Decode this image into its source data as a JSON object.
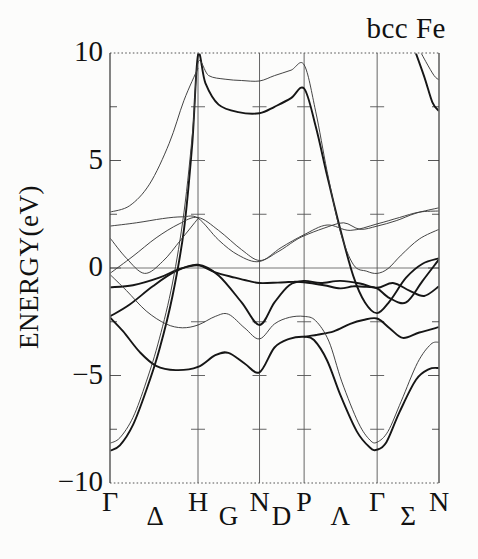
{
  "title": "bcc Fe",
  "chart_data": {
    "type": "line",
    "title": "bcc Fe",
    "subtitle": "electronic band structure, spin-polarized (thick = majority spin, thin = minority spin)",
    "ylabel": "ENERGY(eV)",
    "xlabel": "",
    "ylim": [
      -10,
      10
    ],
    "grid": "vertical lines at interior high-symmetry points; tick crosses every 2.5 eV",
    "legend_position": "none",
    "fermi_energy": 0,
    "yticks": [
      {
        "label": "10",
        "value": 10
      },
      {
        "label": "5",
        "value": 5
      },
      {
        "label": "0",
        "value": 0
      },
      {
        "label": "−5",
        "value": -5
      },
      {
        "label": "−10",
        "value": -10
      }
    ],
    "minor_tick_step_ev": 2.5,
    "kpath": {
      "points": [
        {
          "label": "Γ",
          "k": 0.0
        },
        {
          "label": "H",
          "k": 0.2675
        },
        {
          "label": "N",
          "k": 0.4545
        },
        {
          "label": "P",
          "k": 0.59
        },
        {
          "label": "Γ",
          "k": 0.812
        },
        {
          "label": "N",
          "k": 1.0
        }
      ],
      "segments": [
        {
          "label": "Δ",
          "k": 0.137
        },
        {
          "label": "G",
          "k": 0.36
        },
        {
          "label": "D",
          "k": 0.521
        },
        {
          "label": "Λ",
          "k": 0.7
        },
        {
          "label": "Σ",
          "k": 0.906
        }
      ]
    },
    "colors": {
      "band_majority": "#161616",
      "band_minority": "#3a3a3a",
      "frame": "#333333",
      "gridline": "#555555",
      "fermi_line": "#555555",
      "background": "#fcfcfb"
    },
    "series": [
      {
        "name": "majority-spin",
        "line_width": 1.9,
        "color": "#161616",
        "bands": [
          [
            [
              0,
              -8.5
            ],
            [
              0.03,
              -8.25
            ],
            [
              0.07,
              -7.3
            ],
            [
              0.11,
              -5.7
            ],
            [
              0.15,
              -3.8
            ],
            [
              0.19,
              -1.3
            ],
            [
              0.225,
              1.8
            ],
            [
              0.25,
              5.8
            ],
            [
              0.2675,
              9.9
            ],
            [
              0.29,
              8.6
            ],
            [
              0.33,
              7.6
            ],
            [
              0.39,
              7.25
            ],
            [
              0.4545,
              7.2
            ],
            [
              0.5,
              7.5
            ],
            [
              0.55,
              7.9
            ],
            [
              0.59,
              8.35
            ],
            [
              0.625,
              6.6
            ],
            [
              0.66,
              4.3
            ],
            [
              0.7,
              1.8
            ],
            [
              0.74,
              -0.4
            ],
            [
              0.775,
              -1.6
            ],
            [
              0.812,
              -2.1
            ],
            [
              0.85,
              -1.55
            ],
            [
              0.9,
              -0.45
            ],
            [
              0.95,
              0.2
            ],
            [
              1,
              0.45
            ]
          ],
          [
            [
              0,
              -2.3
            ],
            [
              0.04,
              -2.95
            ],
            [
              0.09,
              -3.9
            ],
            [
              0.14,
              -4.55
            ],
            [
              0.2,
              -4.75
            ],
            [
              0.2675,
              -4.6
            ],
            [
              0.32,
              -4.05
            ],
            [
              0.36,
              -3.95
            ],
            [
              0.41,
              -4.45
            ],
            [
              0.4545,
              -4.85
            ],
            [
              0.5,
              -3.7
            ],
            [
              0.545,
              -3.3
            ],
            [
              0.59,
              -3.2
            ],
            [
              0.62,
              -3.35
            ],
            [
              0.66,
              -4.3
            ],
            [
              0.7,
              -5.9
            ],
            [
              0.75,
              -7.6
            ],
            [
              0.79,
              -8.35
            ],
            [
              0.812,
              -8.45
            ],
            [
              0.84,
              -8.1
            ],
            [
              0.88,
              -6.7
            ],
            [
              0.93,
              -5.2
            ],
            [
              0.97,
              -4.7
            ],
            [
              1,
              -4.65
            ]
          ],
          [
            [
              0,
              -2.25
            ],
            [
              0.06,
              -1.7
            ],
            [
              0.13,
              -0.85
            ],
            [
              0.2,
              -0.15
            ],
            [
              0.2675,
              0.15
            ],
            [
              0.33,
              -0.35
            ],
            [
              0.4,
              -1.6
            ],
            [
              0.4545,
              -2.65
            ],
            [
              0.5,
              -1.6
            ],
            [
              0.545,
              -0.8
            ],
            [
              0.59,
              -0.6
            ],
            [
              0.64,
              -0.7
            ],
            [
              0.7,
              -0.6
            ],
            [
              0.76,
              -0.72
            ],
            [
              0.812,
              -0.92
            ],
            [
              0.86,
              -0.7
            ],
            [
              0.91,
              -1.05
            ],
            [
              0.955,
              -1.3
            ],
            [
              1,
              -0.85
            ]
          ],
          [
            [
              0,
              -0.9
            ],
            [
              0.07,
              -0.8
            ],
            [
              0.15,
              -0.45
            ],
            [
              0.21,
              -0.05
            ],
            [
              0.2675,
              0.12
            ],
            [
              0.32,
              -0.2
            ],
            [
              0.38,
              -0.45
            ],
            [
              0.42,
              -0.6
            ],
            [
              0.4545,
              -0.7
            ],
            [
              0.51,
              -0.68
            ],
            [
              0.56,
              -0.64
            ],
            [
              0.59,
              -0.66
            ],
            [
              0.65,
              -0.8
            ],
            [
              0.7,
              -0.95
            ],
            [
              0.74,
              -0.85
            ],
            [
              0.78,
              -0.88
            ],
            [
              0.812,
              -0.95
            ],
            [
              0.85,
              -1.4
            ],
            [
              0.9,
              -1.6
            ],
            [
              0.95,
              -0.6
            ],
            [
              1,
              0.4
            ]
          ],
          [
            [
              0.92,
              10.4
            ],
            [
              0.955,
              8.9
            ],
            [
              0.98,
              7.7
            ],
            [
              1,
              7.3
            ]
          ],
          [
            [
              0.59,
              -3.2
            ],
            [
              0.63,
              -3.1
            ],
            [
              0.68,
              -2.95
            ],
            [
              0.73,
              -2.6
            ],
            [
              0.77,
              -2.42
            ],
            [
              0.812,
              -2.35
            ],
            [
              0.85,
              -2.8
            ],
            [
              0.89,
              -3.25
            ],
            [
              0.94,
              -3.0
            ],
            [
              1,
              -2.75
            ]
          ]
        ]
      },
      {
        "name": "minority-spin",
        "line_width": 0.95,
        "color": "#3a3a3a",
        "bands": [
          [
            [
              0,
              -8.15
            ],
            [
              0.03,
              -7.9
            ],
            [
              0.07,
              -6.95
            ],
            [
              0.11,
              -5.3
            ],
            [
              0.15,
              -3.3
            ],
            [
              0.19,
              -0.7
            ],
            [
              0.225,
              2.6
            ],
            [
              0.252,
              6.5
            ],
            [
              0.2675,
              9.55
            ],
            [
              0.3,
              8.95
            ],
            [
              0.35,
              8.78
            ],
            [
              0.4,
              8.72
            ],
            [
              0.4545,
              8.7
            ],
            [
              0.5,
              8.95
            ],
            [
              0.55,
              9.2
            ],
            [
              0.59,
              9.45
            ],
            [
              0.625,
              7.3
            ],
            [
              0.66,
              4.5
            ],
            [
              0.7,
              1.7
            ],
            [
              0.74,
              0.15
            ],
            [
              0.78,
              -0.15
            ],
            [
              0.812,
              -0.25
            ],
            [
              0.845,
              -0.03
            ],
            [
              0.885,
              0.6
            ],
            [
              0.94,
              1.35
            ],
            [
              1,
              1.8
            ]
          ],
          [
            [
              0,
              -0.3
            ],
            [
              0.05,
              -1.05
            ],
            [
              0.11,
              -2.0
            ],
            [
              0.17,
              -2.6
            ],
            [
              0.22,
              -2.78
            ],
            [
              0.2675,
              -2.65
            ],
            [
              0.32,
              -2.25
            ],
            [
              0.36,
              -2.15
            ],
            [
              0.41,
              -2.8
            ],
            [
              0.4545,
              -3.3
            ],
            [
              0.5,
              -2.6
            ],
            [
              0.545,
              -2.3
            ],
            [
              0.59,
              -2.25
            ],
            [
              0.625,
              -2.45
            ],
            [
              0.665,
              -3.4
            ],
            [
              0.705,
              -5.3
            ],
            [
              0.755,
              -7.2
            ],
            [
              0.79,
              -8.0
            ],
            [
              0.812,
              -8.1
            ],
            [
              0.845,
              -7.6
            ],
            [
              0.885,
              -6.2
            ],
            [
              0.935,
              -4.4
            ],
            [
              0.975,
              -3.55
            ],
            [
              1,
              -3.45
            ]
          ],
          [
            [
              0,
              -0.25
            ],
            [
              0.07,
              0.55
            ],
            [
              0.14,
              1.4
            ],
            [
              0.21,
              2.05
            ],
            [
              0.2675,
              2.35
            ],
            [
              0.33,
              1.75
            ],
            [
              0.4,
              0.85
            ],
            [
              0.4545,
              0.35
            ],
            [
              0.51,
              0.75
            ],
            [
              0.56,
              1.25
            ],
            [
              0.59,
              1.5
            ],
            [
              0.65,
              1.85
            ],
            [
              0.71,
              2.1
            ],
            [
              0.76,
              1.8
            ],
            [
              0.812,
              1.95
            ],
            [
              0.87,
              2.2
            ],
            [
              0.93,
              2.55
            ],
            [
              1,
              2.8
            ]
          ],
          [
            [
              0,
              1.95
            ],
            [
              0.08,
              2.1
            ],
            [
              0.16,
              2.3
            ],
            [
              0.22,
              2.38
            ],
            [
              0.2675,
              2.32
            ],
            [
              0.33,
              1.3
            ],
            [
              0.39,
              0.6
            ],
            [
              0.4545,
              0.3
            ],
            [
              0.52,
              0.95
            ],
            [
              0.59,
              1.55
            ],
            [
              0.66,
              2.0
            ],
            [
              0.73,
              1.75
            ],
            [
              0.812,
              2.05
            ],
            [
              0.88,
              2.35
            ],
            [
              0.94,
              2.6
            ],
            [
              1,
              2.65
            ]
          ],
          [
            [
              0.925,
              10.6
            ],
            [
              0.96,
              9.6
            ],
            [
              0.985,
              8.95
            ],
            [
              1,
              8.75
            ]
          ],
          [
            [
              0,
              1.4
            ],
            [
              0.05,
              0.45
            ],
            [
              0.105,
              -0.25
            ],
            [
              0.16,
              0.3
            ],
            [
              0.215,
              1.3
            ],
            [
              0.2675,
              2.3
            ]
          ],
          [
            [
              0,
              2.6
            ],
            [
              0.06,
              2.9
            ],
            [
              0.12,
              3.9
            ],
            [
              0.18,
              5.8
            ],
            [
              0.225,
              7.8
            ],
            [
              0.2675,
              9.3
            ]
          ]
        ]
      }
    ]
  }
}
